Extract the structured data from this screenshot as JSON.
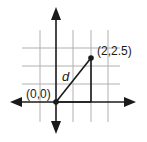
{
  "diagram": {
    "type": "coordinate-plane",
    "grid": {
      "vertical_x": [
        40,
        56,
        73,
        91,
        108
      ],
      "horizontal_y": [
        48,
        66,
        84,
        102
      ],
      "color": "#b0b0b0"
    },
    "axes": {
      "color": "#1a1a1a",
      "origin_px": [
        56,
        102
      ]
    },
    "points": [
      {
        "label": "(0,0)",
        "coords": [
          0,
          0
        ]
      },
      {
        "label": "(2,2.5)",
        "coords": [
          2,
          2.5
        ]
      }
    ],
    "segments": [
      {
        "label": "d",
        "from": "(0,0)",
        "to": "(2,2.5)",
        "role": "hypotenuse"
      },
      {
        "from": "(0,0)",
        "to": "(2,0)",
        "role": "horizontal-leg"
      },
      {
        "from": "(2,0)",
        "to": "(2,2.5)",
        "role": "vertical-leg"
      }
    ],
    "labels": {
      "origin": "(0,0)",
      "point": "(2,2.5)",
      "distance": "d"
    }
  }
}
